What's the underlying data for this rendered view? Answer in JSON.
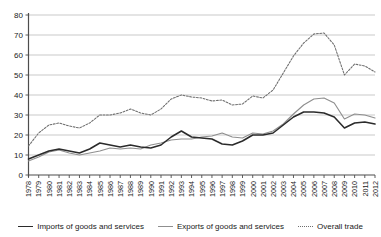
{
  "chart_data": {
    "type": "line",
    "title": "",
    "xlabel": "",
    "ylabel": "",
    "ylim": [
      0,
      80
    ],
    "ytick_values": [
      0,
      10,
      20,
      30,
      40,
      50,
      60,
      70,
      80
    ],
    "grid": true,
    "legend_position": "bottom",
    "x": [
      1978,
      1979,
      1980,
      1981,
      1982,
      1983,
      1984,
      1985,
      1986,
      1987,
      1988,
      1989,
      1990,
      1991,
      1992,
      1993,
      1994,
      1995,
      1996,
      1997,
      1998,
      1999,
      2000,
      2001,
      2002,
      2003,
      2004,
      2005,
      2006,
      2007,
      2008,
      2009,
      2010,
      2011,
      2012
    ],
    "categories": [
      "1978",
      "1979",
      "1980",
      "1981",
      "1982",
      "1983",
      "1984",
      "1985",
      "1986",
      "1987",
      "1988",
      "1989",
      "1990",
      "1991",
      "1992",
      "1993",
      "1994",
      "1995",
      "1996",
      "1997",
      "1998",
      "1999",
      "2000",
      "2001",
      "2002",
      "2003",
      "2004",
      "2005",
      "2006",
      "2007",
      "2008",
      "2009",
      "2010",
      "2011",
      "2012"
    ],
    "series": [
      {
        "name": "Imports of goods and services",
        "style": "solid",
        "color": "#2b2b2b",
        "values": [
          8.0,
          10.0,
          12.0,
          13.0,
          12.0,
          11.0,
          13.0,
          16.0,
          15.0,
          14.0,
          15.0,
          14.0,
          13.5,
          15.0,
          19.0,
          22.0,
          19.0,
          18.5,
          18.0,
          15.5,
          15.0,
          17.0,
          20.0,
          20.0,
          21.0,
          25.0,
          29.0,
          31.5,
          31.5,
          31.0,
          29.0,
          23.5,
          26.0,
          26.5,
          25.5
        ]
      },
      {
        "name": "Exports of goods and services",
        "style": "solid",
        "color": "#8f8f8f",
        "values": [
          7.0,
          9.0,
          11.5,
          12.5,
          11.0,
          10.0,
          11.0,
          12.0,
          13.5,
          13.0,
          13.5,
          13.0,
          15.0,
          16.0,
          17.5,
          18.0,
          18.0,
          19.0,
          19.5,
          21.0,
          19.0,
          18.5,
          21.0,
          20.5,
          22.0,
          25.5,
          30.5,
          35.0,
          38.0,
          38.5,
          36.0,
          28.0,
          30.5,
          30.0,
          28.5
        ]
      },
      {
        "name": "Overall trade",
        "style": "dotted",
        "color": "#6e6e6e",
        "values": [
          14.5,
          21.0,
          25.0,
          26.0,
          24.5,
          23.5,
          26.0,
          30.0,
          30.0,
          31.0,
          33.0,
          31.0,
          30.0,
          33.0,
          38.0,
          40.0,
          39.0,
          38.5,
          37.0,
          37.5,
          35.0,
          35.5,
          39.5,
          38.5,
          42.5,
          51.0,
          59.5,
          66.0,
          70.5,
          71.0,
          65.0,
          50.0,
          55.5,
          54.5,
          51.5
        ]
      }
    ]
  },
  "legend": {
    "items": [
      {
        "label": "Imports of goods and services",
        "swatch": "solid-dark-line-icon"
      },
      {
        "label": "Exports of goods and services",
        "swatch": "solid-gray-line-icon"
      },
      {
        "label": "Overall trade",
        "swatch": "dotted-line-icon"
      }
    ]
  }
}
